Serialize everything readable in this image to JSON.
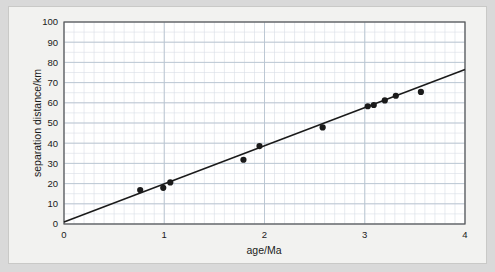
{
  "chart_data": {
    "type": "scatter",
    "title": "",
    "xlabel": "age/Ma",
    "ylabel": "separation distance/km",
    "xlim": [
      0,
      4
    ],
    "ylim": [
      0,
      100
    ],
    "xticks": [
      0,
      1,
      2,
      3,
      4
    ],
    "xtick_labels": [
      "0",
      "1",
      "2",
      "3",
      "4"
    ],
    "yticks": [
      0,
      10,
      20,
      30,
      40,
      50,
      60,
      70,
      80,
      90,
      100
    ],
    "ytick_labels": [
      "0",
      "10",
      "20",
      "30",
      "40",
      "50",
      "60",
      "70",
      "80",
      "90",
      "100"
    ],
    "grid": true,
    "grid_minor": true,
    "grid_minor_step_x": 0.1,
    "grid_minor_step_y": 5,
    "legend": null,
    "marker": "filled-circle",
    "marker_color": "#1a1a1a",
    "grid_color": "#b8c4d0",
    "minor_grid_color": "#d8dee6",
    "axis_color": "#555555",
    "plot_bg": "#ffffff",
    "figure_bg": "#f2f2f0",
    "outer_bg": "#d9d9d9",
    "x": [
      0.76,
      0.99,
      1.06,
      1.79,
      1.95,
      2.58,
      3.03,
      3.09,
      3.2,
      3.31,
      3.56
    ],
    "y": [
      16.8,
      17.9,
      20.6,
      31.8,
      38.6,
      47.8,
      58.3,
      58.9,
      61.2,
      63.5,
      65.4
    ],
    "points": [
      {
        "x": 0.76,
        "y": 16.8
      },
      {
        "x": 0.99,
        "y": 17.9
      },
      {
        "x": 1.06,
        "y": 20.6
      },
      {
        "x": 1.79,
        "y": 31.8
      },
      {
        "x": 1.95,
        "y": 38.6
      },
      {
        "x": 2.58,
        "y": 47.8
      },
      {
        "x": 3.03,
        "y": 58.3
      },
      {
        "x": 3.09,
        "y": 58.9
      },
      {
        "x": 3.2,
        "y": 61.2
      },
      {
        "x": 3.31,
        "y": 63.5
      },
      {
        "x": 3.56,
        "y": 65.4
      }
    ],
    "trendline": {
      "type": "line",
      "x": [
        0.0,
        4.0
      ],
      "y": [
        1.0,
        76.5
      ],
      "slope": 18.875,
      "intercept": 1.0,
      "color": "#1a1a1a"
    }
  }
}
